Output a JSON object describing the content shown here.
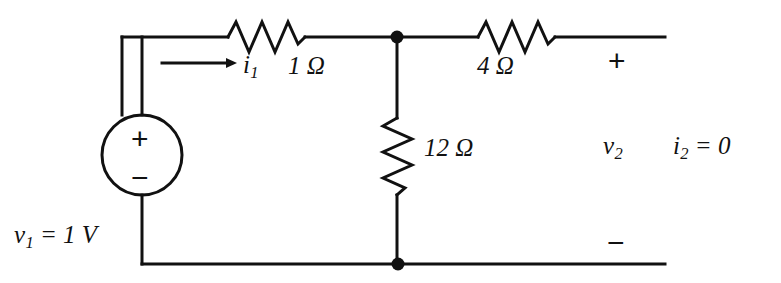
{
  "figure": {
    "kind": "circuit-schematic",
    "width": 781,
    "height": 283,
    "background_color": "#ffffff",
    "line_color": "#111111"
  },
  "labels": {
    "source_value": "v",
    "source_sub": "1",
    "source_eq": " = 1 V",
    "current_in": "i",
    "current_in_sub": "1",
    "r_series1": "1 Ω",
    "r_series2": "4 Ω",
    "r_shunt": "12 Ω",
    "v_out": "v",
    "v_out_sub": "2",
    "i_out": "i",
    "i_out_sub": "2",
    "i_out_eq": " = 0",
    "plus_sign": "+",
    "minus_sign": "−"
  },
  "components": {
    "voltage_source": {
      "name": "independent-voltage-source",
      "label": "v1 = 1 V",
      "polarity_top": "+",
      "polarity_bottom": "−",
      "center_x": 142,
      "center_y": 155,
      "radius": 40
    },
    "resistors": [
      {
        "name": "resistor-1-ohm",
        "value": "1 Ω",
        "orientation": "horizontal",
        "x1": 228,
        "x2": 305,
        "y": 37
      },
      {
        "name": "resistor-4-ohm",
        "value": "4 Ω",
        "orientation": "horizontal",
        "x1": 478,
        "x2": 555,
        "y": 37
      },
      {
        "name": "resistor-12-ohm",
        "value": "12 Ω",
        "orientation": "vertical",
        "x": 397,
        "y1": 118,
        "y2": 195
      }
    ],
    "nodes": [
      {
        "name": "node-top",
        "x": 397,
        "y": 37,
        "r": 6
      },
      {
        "name": "node-bottom",
        "x": 398,
        "y": 264,
        "r": 6
      }
    ],
    "current_arrow": {
      "name": "current-arrow-i1",
      "x1": 162,
      "x2": 237,
      "y": 63
    },
    "wires": {
      "top_y": 37,
      "bottom_y": 264,
      "left_x": 122,
      "right_x": 665
    }
  }
}
